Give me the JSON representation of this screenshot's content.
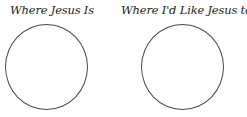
{
  "diagram": {
    "panels": [
      {
        "title": "Where Jesus Is"
      },
      {
        "title": "Where I'd Like Jesus to Be"
      }
    ],
    "colors": {
      "stroke": "#4a4a4a",
      "text": "#1e1e1e",
      "background": "#ffffff"
    }
  }
}
